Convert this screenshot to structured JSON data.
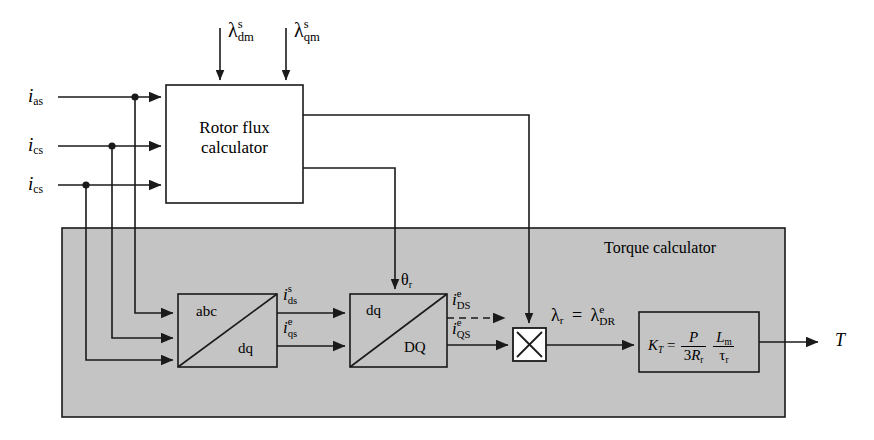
{
  "diagram": {
    "panel_label": "Torque calculator",
    "panel_color": "#c4c4c4",
    "line_color": "#1a1a1a",
    "background": "#ffffff"
  },
  "inputs": {
    "currents": [
      {
        "name": "i_as",
        "base": "i",
        "sub": "as"
      },
      {
        "name": "i_cs_2",
        "base": "i",
        "sub": "cs"
      },
      {
        "name": "i_cs_3",
        "base": "i",
        "sub": "cs"
      }
    ],
    "fluxes": [
      {
        "name": "lambda_dm_s",
        "base": "λ",
        "sup": "s",
        "sub": "dm"
      },
      {
        "name": "lambda_qm_s",
        "base": "λ",
        "sup": "s",
        "sub": "qm"
      }
    ]
  },
  "blocks": {
    "rotor_flux": {
      "line1": "Rotor flux",
      "line2": "calculator"
    },
    "abc_dq": {
      "upper": "abc",
      "lower": "dq"
    },
    "dq_DQ": {
      "upper": "dq",
      "lower": "DQ"
    },
    "multiplier": {
      "symbol": "×"
    },
    "gain": {
      "lhs_base": "K",
      "lhs_sub": "T",
      "equals": "=",
      "frac1_num": "P",
      "frac1_den_coef": "3",
      "frac1_den_base": "R",
      "frac1_den_sub": "r",
      "frac2_num_base": "L",
      "frac2_num_sub": "m",
      "frac2_den_base": "τ",
      "frac2_den_sub": "r"
    }
  },
  "signals": {
    "ids_s": {
      "base": "i",
      "sup": "s",
      "sub": "ds"
    },
    "iqs_e": {
      "base": "i",
      "sup": "e",
      "sub": "qs"
    },
    "iDS_e": {
      "base": "i",
      "sup": "e",
      "sub": "DS"
    },
    "iQS_e": {
      "base": "i",
      "sup": "e",
      "sub": "QS"
    },
    "theta_r": {
      "base": "θ",
      "sub": "r"
    },
    "lambda_r": {
      "base": "λ",
      "sub": "r"
    },
    "equals": "=",
    "lambda_DR_e": {
      "base": "λ",
      "sup": "e",
      "sub": "DR"
    },
    "torque_out": "T"
  }
}
